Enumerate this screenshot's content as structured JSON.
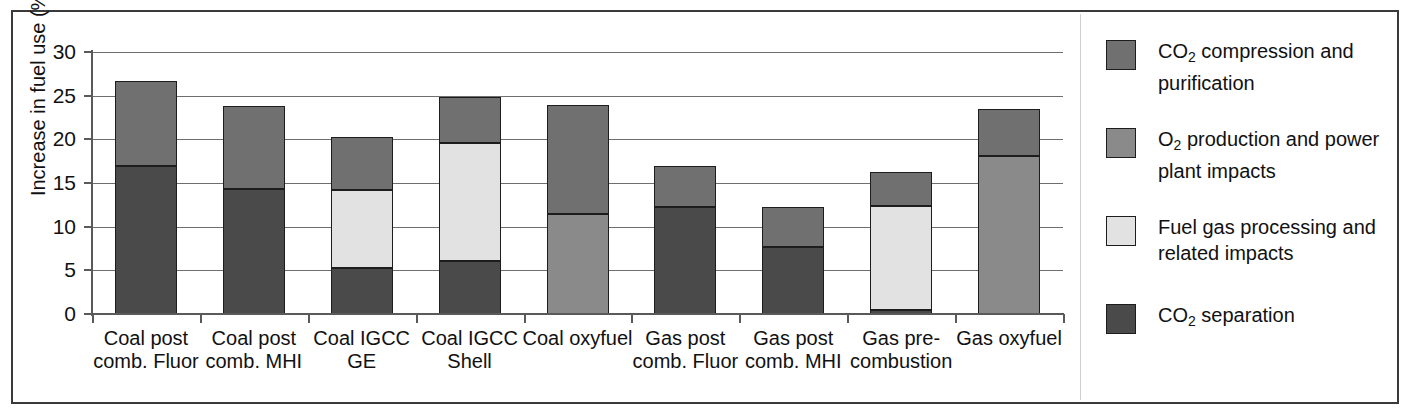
{
  "chart_data": {
    "type": "bar",
    "subtype": "stacked-bar",
    "title": "",
    "xlabel": "",
    "ylabel": "Increase in fuel use (%)",
    "ylim": [
      0,
      30
    ],
    "yticks": [
      0,
      5,
      10,
      15,
      20,
      25,
      30
    ],
    "ytick_labels": [
      "0",
      "5",
      "10",
      "15",
      "20",
      "25",
      "30"
    ],
    "grid": true,
    "legend_position": "right",
    "categories": [
      "Coal post comb. Fluor",
      "Coal post comb. MHI",
      "Coal IGCC GE",
      "Coal IGCC Shell",
      "Coal oxyfuel",
      "Gas post comb. Fluor",
      "Gas post comb. MHI",
      "Gas pre-combustion",
      "Gas oxyfuel"
    ],
    "category_lines": [
      [
        "Coal post",
        "comb. Fluor"
      ],
      [
        "Coal post",
        "comb. MHI"
      ],
      [
        "Coal IGCC",
        "GE"
      ],
      [
        "Coal IGCC",
        "Shell"
      ],
      [
        "Coal oxyfuel"
      ],
      [
        "Gas post",
        "comb. Fluor"
      ],
      [
        "Gas post",
        "comb. MHI"
      ],
      [
        "Gas pre-",
        "combustion"
      ],
      [
        "Gas oxyfuel"
      ]
    ],
    "series": [
      {
        "name": "CO2 separation",
        "key": "co2_separation",
        "color": "#4a4a4a",
        "values": [
          16.9,
          14.3,
          5.3,
          6.1,
          0,
          12.3,
          7.7,
          0.5,
          0
        ]
      },
      {
        "name": "Fuel gas processing and related impacts",
        "key": "fuel_gas_processing",
        "color": "#e2e2e2",
        "values": [
          0,
          0,
          8.9,
          13.5,
          0,
          0,
          0,
          11.9,
          0
        ]
      },
      {
        "name": "O2 production and power plant impacts",
        "key": "o2_production",
        "color": "#8a8a8a",
        "values": [
          0,
          0,
          0,
          0,
          11.4,
          0,
          0,
          0,
          18.1
        ]
      },
      {
        "name": "CO2 compression and purification",
        "key": "co2_compression",
        "color": "#707070",
        "values": [
          9.8,
          9.5,
          6.1,
          5.3,
          12.5,
          4.7,
          4.5,
          3.9,
          5.4
        ]
      }
    ],
    "totals": [
      26.7,
      23.8,
      20.3,
      24.9,
      23.9,
      17.0,
      12.2,
      16.3,
      23.5
    ]
  },
  "axis": {
    "y_label": "Increase in fuel use (%)",
    "y_ticks": [
      "30",
      "25",
      "20",
      "15",
      "10",
      "5",
      "0"
    ]
  },
  "legend": {
    "items": [
      {
        "id": "co2-compression-and-purification",
        "color": "#707070",
        "line1_pre": "CO",
        "line1_sub": "2",
        "line1_post": " compression and",
        "line2": "purification",
        "label": "CO2 compression and purification"
      },
      {
        "id": "o2-production-and-power-plant-impacts",
        "color": "#8a8a8a",
        "line1_pre": "O",
        "line1_sub": "2",
        "line1_post": " production and power",
        "line2": "plant impacts",
        "label": "O2 production and power plant impacts"
      },
      {
        "id": "fuel-gas-processing-and-related-impacts",
        "color": "#e2e2e2",
        "line1_pre": "Fuel gas processing and",
        "line1_sub": "",
        "line1_post": "",
        "line2": "related impacts",
        "label": "Fuel gas processing and related impacts"
      },
      {
        "id": "co2-separation",
        "color": "#4a4a4a",
        "line1_pre": "CO",
        "line1_sub": "2",
        "line1_post": " separation",
        "line2": "",
        "label": "CO2 separation"
      }
    ]
  }
}
